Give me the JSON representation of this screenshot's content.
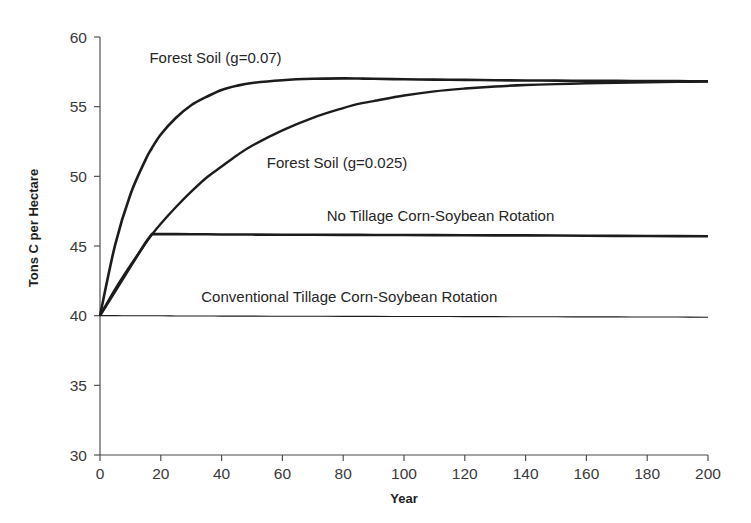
{
  "chart_data": {
    "type": "line",
    "title": "",
    "xlabel": "Year",
    "ylabel": "Tons C per Hectare",
    "xlim": [
      0,
      200
    ],
    "ylim": [
      30,
      60
    ],
    "xticks": [
      0,
      20,
      40,
      60,
      80,
      100,
      120,
      140,
      160,
      180,
      200
    ],
    "yticks": [
      30,
      35,
      40,
      45,
      50,
      55,
      60
    ],
    "xtick_labels": [
      "0",
      "20",
      "40",
      "60",
      "80",
      "100",
      "120",
      "140",
      "160",
      "180",
      "200"
    ],
    "ytick_labels": [
      "30",
      "35",
      "40",
      "45",
      "50",
      "55",
      "60"
    ],
    "grid": false,
    "legend": "inline-annotations",
    "line_color": "#1c1c1c",
    "axis_color": "#4a4a4a",
    "background": "#ffffff",
    "x": [
      0,
      5,
      10,
      15,
      17,
      20,
      25,
      30,
      35,
      40,
      45,
      50,
      60,
      70,
      80,
      85,
      90,
      100,
      110,
      120,
      130,
      140,
      150,
      160,
      170,
      180,
      190,
      200
    ],
    "series": [
      {
        "name": "Forest Soil (g=0.07)",
        "label": "Forest Soil (g=0.07)",
        "label_x": 38,
        "label_y": 58.1,
        "width": "thick",
        "values": [
          40.0,
          45.1,
          48.7,
          51.2,
          52.0,
          53.0,
          54.2,
          55.1,
          55.7,
          56.2,
          56.5,
          56.7,
          56.9,
          57.0,
          57.03,
          57.02,
          57.0,
          56.97,
          56.94,
          56.92,
          56.9,
          56.88,
          56.87,
          56.86,
          56.85,
          56.84,
          56.83,
          56.82
        ]
      },
      {
        "name": "Forest Soil (g=0.025)",
        "label": "Forest Soil (g=0.025)",
        "label_x": 78,
        "label_y": 50.6,
        "width": "med",
        "values": [
          40.0,
          41.9,
          43.6,
          45.2,
          45.8,
          46.6,
          47.8,
          48.9,
          49.9,
          50.7,
          51.5,
          52.2,
          53.3,
          54.2,
          54.9,
          55.2,
          55.4,
          55.8,
          56.1,
          56.3,
          56.45,
          56.55,
          56.62,
          56.68,
          56.72,
          56.75,
          56.78,
          56.8
        ]
      },
      {
        "name": "No Tillage Corn-Soybean Rotation",
        "label": "No Tillage Corn-Soybean Rotation",
        "label_x": 112,
        "label_y": 46.8,
        "width": "thick",
        "values": [
          40.0,
          41.75,
          43.5,
          45.25,
          45.85,
          45.85,
          45.85,
          45.84,
          45.84,
          45.83,
          45.83,
          45.82,
          45.81,
          45.81,
          45.8,
          45.8,
          45.79,
          45.79,
          45.78,
          45.77,
          45.76,
          45.76,
          45.75,
          45.74,
          45.73,
          45.72,
          45.71,
          45.7
        ]
      },
      {
        "name": "Conventional Tillage Corn-Soybean Rotation",
        "label": "Conventional Tillage Corn-Soybean Rotation",
        "label_x": 82,
        "label_y": 41.0,
        "width": "thin",
        "values": [
          40.0,
          40.0,
          39.99,
          39.99,
          39.99,
          39.99,
          39.98,
          39.98,
          39.98,
          39.97,
          39.97,
          39.97,
          39.96,
          39.96,
          39.95,
          39.95,
          39.95,
          39.94,
          39.94,
          39.93,
          39.93,
          39.92,
          39.92,
          39.91,
          39.91,
          39.9,
          39.9,
          39.89
        ]
      }
    ]
  }
}
